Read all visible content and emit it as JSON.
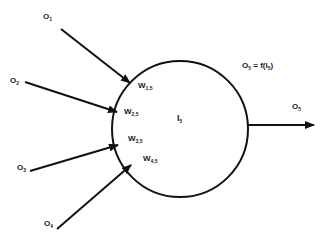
{
  "diagram": {
    "type": "artificial-neuron",
    "colors": {
      "stroke": "#111111",
      "text": "#1a1a1a",
      "background": "#ffffff"
    },
    "neuron": {
      "label_main": "I",
      "label_sub": "5",
      "center": [
        180,
        129
      ],
      "radius": 68
    },
    "inputs": [
      {
        "label_main": "O",
        "label_sub": "1",
        "weight_main": "W",
        "weight_sub": "1,5"
      },
      {
        "label_main": "O",
        "label_sub": "2",
        "weight_main": "W",
        "weight_sub": "2,5"
      },
      {
        "label_main": "O",
        "label_sub": "3",
        "weight_main": "W",
        "weight_sub": "3,5"
      },
      {
        "label_main": "O",
        "label_sub": "4",
        "weight_main": "W",
        "weight_sub": "4,5"
      }
    ],
    "output": {
      "label_main": "O",
      "label_sub": "5"
    },
    "formula": {
      "lhs_main": "O",
      "lhs_sub": "5",
      "mid": " = f(I",
      "arg_sub": "5",
      "end": ")"
    }
  }
}
